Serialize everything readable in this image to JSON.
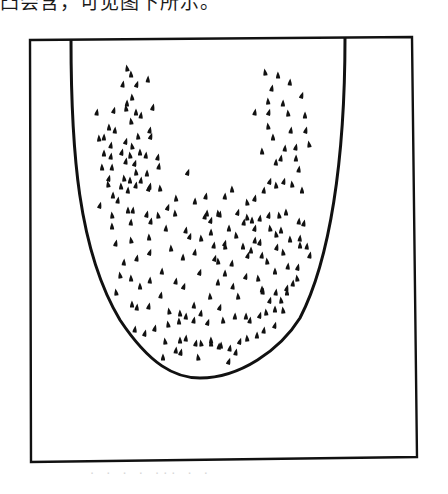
{
  "document": {
    "top_text_fragment": "凸会含，可见图下所示。",
    "bottom_text_fragment": "· · ·  ·  ··· · ·",
    "ink_color": "#111111",
    "background_color": "#ffffff"
  },
  "figure": {
    "frame": {
      "x1": 30,
      "y1": 39,
      "x2": 414,
      "y2": 460
    },
    "u_curve": {
      "path": "M71,39 C71,150 78,250 120,320 C150,365 175,378 200,378 C240,378 280,350 300,318 C330,260 345,160 345,38"
    },
    "dots": [
      [
        127,
        68
      ],
      [
        131,
        74
      ],
      [
        148,
        79
      ],
      [
        123,
        84
      ],
      [
        137,
        84
      ],
      [
        132,
        97
      ],
      [
        127,
        103
      ],
      [
        97,
        112
      ],
      [
        114,
        110
      ],
      [
        126,
        108
      ],
      [
        136,
        112
      ],
      [
        141,
        115
      ],
      [
        153,
        107
      ],
      [
        131,
        121
      ],
      [
        109,
        127
      ],
      [
        115,
        130
      ],
      [
        150,
        130
      ],
      [
        151,
        136
      ],
      [
        99,
        138
      ],
      [
        104,
        137
      ],
      [
        111,
        145
      ],
      [
        126,
        141
      ],
      [
        138,
        136
      ],
      [
        104,
        153
      ],
      [
        111,
        156
      ],
      [
        122,
        152
      ],
      [
        130,
        155
      ],
      [
        140,
        152
      ],
      [
        146,
        155
      ],
      [
        158,
        157
      ],
      [
        132,
        146
      ],
      [
        102,
        167
      ],
      [
        112,
        167
      ],
      [
        126,
        161
      ],
      [
        135,
        163
      ],
      [
        136,
        172
      ],
      [
        147,
        173
      ],
      [
        159,
        166
      ],
      [
        109,
        178
      ],
      [
        124,
        178
      ],
      [
        130,
        180
      ],
      [
        141,
        180
      ],
      [
        150,
        186
      ],
      [
        265,
        72
      ],
      [
        278,
        75
      ],
      [
        290,
        82
      ],
      [
        272,
        88
      ],
      [
        302,
        95
      ],
      [
        268,
        101
      ],
      [
        283,
        103
      ],
      [
        255,
        112
      ],
      [
        269,
        112
      ],
      [
        288,
        113
      ],
      [
        305,
        115
      ],
      [
        291,
        130
      ],
      [
        306,
        130
      ],
      [
        268,
        126
      ],
      [
        273,
        137
      ],
      [
        285,
        148
      ],
      [
        296,
        147
      ],
      [
        309,
        144
      ],
      [
        262,
        151
      ],
      [
        276,
        162
      ],
      [
        281,
        158
      ],
      [
        270,
        181
      ],
      [
        276,
        185
      ],
      [
        296,
        158
      ],
      [
        299,
        169
      ],
      [
        284,
        181
      ],
      [
        292,
        184
      ],
      [
        302,
        190
      ],
      [
        264,
        190
      ],
      [
        255,
        198
      ],
      [
        247,
        202
      ],
      [
        232,
        189
      ],
      [
        225,
        196
      ],
      [
        206,
        196
      ],
      [
        188,
        172
      ],
      [
        176,
        198
      ],
      [
        207,
        213
      ],
      [
        220,
        214
      ],
      [
        238,
        212
      ],
      [
        247,
        217
      ],
      [
        252,
        220
      ],
      [
        260,
        218
      ],
      [
        269,
        215
      ],
      [
        279,
        215
      ],
      [
        286,
        212
      ],
      [
        299,
        221
      ],
      [
        304,
        223
      ],
      [
        108,
        184
      ],
      [
        121,
        186
      ],
      [
        128,
        190
      ],
      [
        136,
        185
      ],
      [
        149,
        188
      ],
      [
        160,
        188
      ],
      [
        113,
        195
      ],
      [
        118,
        200
      ],
      [
        100,
        205
      ],
      [
        112,
        215
      ],
      [
        128,
        210
      ],
      [
        133,
        210
      ],
      [
        147,
        214
      ],
      [
        158,
        215
      ],
      [
        112,
        226
      ],
      [
        131,
        222
      ],
      [
        151,
        221
      ],
      [
        168,
        207
      ],
      [
        175,
        213
      ],
      [
        195,
        201
      ],
      [
        205,
        216
      ],
      [
        211,
        220
      ],
      [
        218,
        213
      ],
      [
        229,
        228
      ],
      [
        244,
        222
      ],
      [
        255,
        228
      ],
      [
        270,
        228
      ],
      [
        281,
        230
      ],
      [
        300,
        238
      ],
      [
        116,
        243
      ],
      [
        131,
        240
      ],
      [
        149,
        237
      ],
      [
        166,
        228
      ],
      [
        186,
        230
      ],
      [
        190,
        236
      ],
      [
        201,
        238
      ],
      [
        211,
        232
      ],
      [
        214,
        245
      ],
      [
        225,
        243
      ],
      [
        236,
        235
      ],
      [
        243,
        246
      ],
      [
        255,
        240
      ],
      [
        260,
        242
      ],
      [
        276,
        234
      ],
      [
        290,
        239
      ],
      [
        124,
        262
      ],
      [
        137,
        258
      ],
      [
        150,
        252
      ],
      [
        171,
        248
      ],
      [
        183,
        257
      ],
      [
        195,
        252
      ],
      [
        215,
        258
      ],
      [
        225,
        246
      ],
      [
        251,
        250
      ],
      [
        262,
        255
      ],
      [
        277,
        247
      ],
      [
        283,
        252
      ],
      [
        300,
        245
      ],
      [
        307,
        246
      ],
      [
        310,
        255
      ],
      [
        120,
        275
      ],
      [
        131,
        278
      ],
      [
        162,
        271
      ],
      [
        176,
        281
      ],
      [
        200,
        272
      ],
      [
        218,
        261
      ],
      [
        225,
        273
      ],
      [
        232,
        263
      ],
      [
        248,
        255
      ],
      [
        267,
        261
      ],
      [
        275,
        271
      ],
      [
        288,
        266
      ],
      [
        298,
        267
      ],
      [
        116,
        292
      ],
      [
        140,
        286
      ],
      [
        150,
        280
      ],
      [
        161,
        295
      ],
      [
        184,
        286
      ],
      [
        210,
        296
      ],
      [
        218,
        282
      ],
      [
        233,
        286
      ],
      [
        246,
        276
      ],
      [
        258,
        278
      ],
      [
        262,
        289
      ],
      [
        276,
        292
      ],
      [
        287,
        288
      ],
      [
        297,
        278
      ],
      [
        132,
        304
      ],
      [
        137,
        307
      ],
      [
        149,
        306
      ],
      [
        169,
        311
      ],
      [
        180,
        313
      ],
      [
        194,
        305
      ],
      [
        201,
        313
      ],
      [
        220,
        307
      ],
      [
        238,
        296
      ],
      [
        246,
        316
      ],
      [
        263,
        291
      ],
      [
        270,
        300
      ],
      [
        281,
        300
      ],
      [
        287,
        292
      ],
      [
        293,
        283
      ],
      [
        155,
        328
      ],
      [
        168,
        324
      ],
      [
        179,
        321
      ],
      [
        186,
        316
      ],
      [
        194,
        320
      ],
      [
        208,
        322
      ],
      [
        223,
        320
      ],
      [
        235,
        316
      ],
      [
        250,
        320
      ],
      [
        260,
        315
      ],
      [
        266,
        312
      ],
      [
        275,
        309
      ],
      [
        135,
        329
      ],
      [
        145,
        333
      ],
      [
        165,
        341
      ],
      [
        180,
        340
      ],
      [
        186,
        338
      ],
      [
        196,
        343
      ],
      [
        201,
        343
      ],
      [
        211,
        343
      ],
      [
        221,
        345
      ],
      [
        230,
        348
      ],
      [
        240,
        341
      ],
      [
        247,
        338
      ],
      [
        257,
        335
      ],
      [
        264,
        330
      ],
      [
        275,
        325
      ],
      [
        283,
        310
      ],
      [
        163,
        357
      ],
      [
        176,
        350
      ],
      [
        181,
        352
      ],
      [
        198,
        357
      ],
      [
        211,
        340
      ],
      [
        219,
        346
      ],
      [
        236,
        352
      ],
      [
        229,
        361
      ]
    ],
    "dot_style": {
      "shape": "teardrop",
      "width": 4,
      "height": 7
    }
  }
}
